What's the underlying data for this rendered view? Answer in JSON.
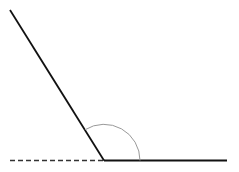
{
  "diagram": {
    "type": "angle",
    "vertex": {
      "x": 104,
      "y": 160
    },
    "slanted_ray": {
      "x1": 10,
      "y1": 10,
      "x2": 104,
      "y2": 160,
      "color": "#111111"
    },
    "base_ray": {
      "x1": 104,
      "y1": 160,
      "x2": 227,
      "y2": 160,
      "color": "#111111"
    },
    "dashed_extension": {
      "x1": 10,
      "y1": 160,
      "x2": 104,
      "y2": 160,
      "color": "#333333"
    },
    "angle_arc": {
      "radius": 36,
      "color": "#999999"
    }
  }
}
